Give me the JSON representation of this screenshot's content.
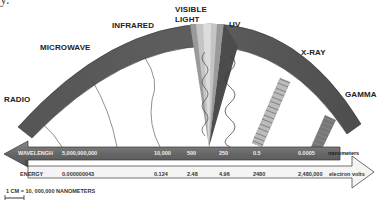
{
  "title_fragment": "y.",
  "bands": [
    {
      "name": "RADIO"
    },
    {
      "name": "MICROWAVE"
    },
    {
      "name": "INFRARED"
    },
    {
      "name": "VISIBLE"
    },
    {
      "name": "LIGHT"
    },
    {
      "name": "UV"
    },
    {
      "name": "X-RAY"
    },
    {
      "name": "GAMMA"
    }
  ],
  "wavelength_scale": {
    "label": "WAVELENGH",
    "values": [
      "5,000,000,000",
      "10,000",
      "500",
      "250",
      "0.5",
      "0.0005"
    ],
    "unit": "nanometers"
  },
  "energy_scale": {
    "label": "ENERGY",
    "values": [
      "0.000000043",
      "0.124",
      "2.48",
      "4.96",
      "2480",
      "2,480,000"
    ],
    "unit": "electron volts"
  },
  "legend": {
    "text": "1 CM  =   10, 000,000 NANOMETERS"
  },
  "colors": {
    "arc": "#5a5a5a",
    "wavelength_bar": "#6b6b6b",
    "energy_bar": "#f2f2f2",
    "visible_wedge": "#b8b8b8"
  }
}
